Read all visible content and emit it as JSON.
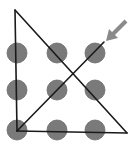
{
  "diagram": {
    "grid": {
      "rows": 3,
      "cols": 3
    },
    "dot_color": "#7a7a7a",
    "line_color": "#1a1a1a",
    "arrow_color": "#8a8a8a",
    "solution_segments": 4,
    "start_marker": "arrow-pointing-to-start"
  }
}
